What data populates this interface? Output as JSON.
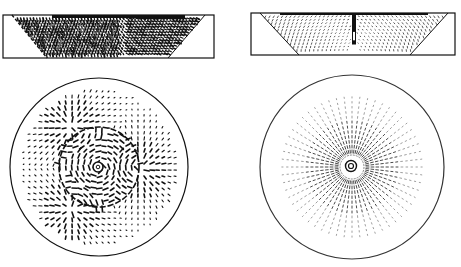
{
  "figure": {
    "background": "#ffffff",
    "ink": "#111111",
    "panels": [
      {
        "id": "left-side-view",
        "kind": "side-section",
        "rect": {
          "x": 3,
          "y": 15,
          "w": 211,
          "h": 43
        },
        "trapezoid": {
          "top_left": 12,
          "top_right": 205,
          "bottom_left": 47,
          "bottom_right": 168
        },
        "pattern": "dense-vertical-streaks",
        "density": "heavy"
      },
      {
        "id": "right-side-view",
        "kind": "side-section",
        "rect": {
          "x": 251,
          "y": 13,
          "w": 204,
          "h": 42
        },
        "trapezoid": {
          "top_left": 260,
          "top_right": 448,
          "bottom_left": 299,
          "bottom_right": 410
        },
        "pattern": "symmetric-arcs-with-central-jet",
        "density": "light"
      },
      {
        "id": "left-top-view",
        "kind": "plan-circle",
        "circle": {
          "cx": 99,
          "cy": 167,
          "r": 89
        },
        "pattern": "multi-cell-radial-with-rings",
        "density": "heavy"
      },
      {
        "id": "right-top-view",
        "kind": "plan-circle",
        "circle": {
          "cx": 352,
          "cy": 167,
          "r": 92
        },
        "pattern": "single-center-radial",
        "density": "light"
      }
    ]
  }
}
